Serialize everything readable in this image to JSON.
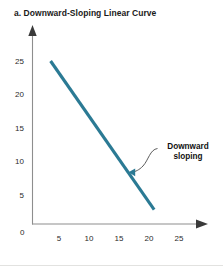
{
  "figure": {
    "panel_label": "a.",
    "title": "a. Downward-Sloping Linear Curve",
    "background_color": "#ffffff"
  },
  "annotation": {
    "line1": "Downward",
    "line2": "sloping"
  },
  "chart_data": {
    "type": "line",
    "title": "a. Downward-Sloping Linear Curve",
    "xlabel": "",
    "ylabel": "",
    "xlim": [
      0,
      29
    ],
    "ylim": [
      0,
      28
    ],
    "xticks": [
      5,
      10,
      15,
      20,
      25
    ],
    "yticks": [
      5,
      10,
      15,
      20,
      25
    ],
    "xtick_labels": [
      "5",
      "10",
      "15",
      "20",
      "25"
    ],
    "ytick_labels": [
      "5",
      "10",
      "15",
      "20",
      "25"
    ],
    "origin_label": "0",
    "grid": false,
    "legend": null,
    "series": [
      {
        "name": "Downward sloping",
        "color": "#2b7a94",
        "linewidth": 3,
        "x": [
          3.3,
          22.2
        ],
        "y": [
          25.0,
          2.2
        ]
      }
    ],
    "annotations": [
      {
        "text": "Downward sloping",
        "target_x": 18.2,
        "target_y": 7.0,
        "leader": "s-curve"
      }
    ]
  },
  "axes": {
    "axis_color": "#8e8e8e",
    "arrow_color": "#3a3a3a",
    "x_tick_labels": [
      {
        "value": "5"
      },
      {
        "value": "10"
      },
      {
        "value": "15"
      },
      {
        "value": "20"
      },
      {
        "value": "25"
      }
    ],
    "y_tick_labels": [
      {
        "value": "25"
      },
      {
        "value": "20"
      },
      {
        "value": "15"
      },
      {
        "value": "10"
      },
      {
        "value": "5"
      }
    ],
    "origin": "0"
  }
}
